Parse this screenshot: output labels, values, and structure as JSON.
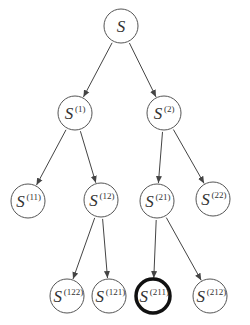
{
  "diagram": {
    "type": "tree",
    "colors": {
      "line": "#444444",
      "node_border": "#555555",
      "highlight_border": "#111111",
      "text": "#333333"
    },
    "nodes": [
      {
        "id": "root",
        "base": "S",
        "sup": "",
        "x": 121,
        "y": 26,
        "highlight": false
      },
      {
        "id": "n1",
        "base": "S",
        "sup": "(1)",
        "x": 75,
        "y": 113,
        "highlight": false
      },
      {
        "id": "n2",
        "base": "S",
        "sup": "(2)",
        "x": 164,
        "y": 113,
        "highlight": false
      },
      {
        "id": "n11",
        "base": "S",
        "sup": "(11)",
        "x": 28,
        "y": 201,
        "highlight": false
      },
      {
        "id": "n12",
        "base": "S",
        "sup": "(12)",
        "x": 101,
        "y": 200,
        "highlight": false
      },
      {
        "id": "n21",
        "base": "S",
        "sup": "(21)",
        "x": 157,
        "y": 201,
        "highlight": false
      },
      {
        "id": "n22",
        "base": "S",
        "sup": "(22)",
        "x": 213,
        "y": 199,
        "highlight": false
      },
      {
        "id": "n122",
        "base": "S",
        "sup": "(122)",
        "x": 67,
        "y": 296,
        "highlight": false
      },
      {
        "id": "n121",
        "base": "S",
        "sup": "(121)",
        "x": 109,
        "y": 296,
        "highlight": false
      },
      {
        "id": "n211",
        "base": "S",
        "sup": "(211)",
        "x": 153,
        "y": 296,
        "highlight": true
      },
      {
        "id": "n212",
        "base": "S",
        "sup": "(212)",
        "x": 210,
        "y": 296,
        "highlight": false
      }
    ],
    "edges": [
      [
        "root",
        "n1"
      ],
      [
        "root",
        "n2"
      ],
      [
        "n1",
        "n11"
      ],
      [
        "n1",
        "n12"
      ],
      [
        "n2",
        "n21"
      ],
      [
        "n2",
        "n22"
      ],
      [
        "n12",
        "n122"
      ],
      [
        "n12",
        "n121"
      ],
      [
        "n21",
        "n211"
      ],
      [
        "n21",
        "n212"
      ]
    ]
  }
}
